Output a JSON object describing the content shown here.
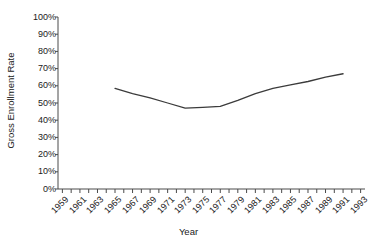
{
  "chart_data": {
    "type": "line",
    "title": "",
    "xlabel": "Year",
    "ylabel": "Gross Enrollment Rate",
    "xlim": [
      1958.5,
      1993.5
    ],
    "ylim": [
      0,
      100
    ],
    "grid": false,
    "legend": "none",
    "line_color": "#3b3b3b",
    "x_tick_labels": [
      "1959",
      "1961",
      "1963",
      "1965",
      "1967",
      "1969",
      "1971",
      "1973",
      "1975",
      "1977",
      "1979",
      "1981",
      "1983",
      "1985",
      "1987",
      "1989",
      "1991",
      "1993"
    ],
    "x_tick_values": [
      1959,
      1961,
      1963,
      1965,
      1967,
      1969,
      1971,
      1973,
      1975,
      1977,
      1979,
      1981,
      1983,
      1985,
      1987,
      1989,
      1991,
      1993
    ],
    "x_minor_ticks": [
      1959,
      1960,
      1961,
      1962,
      1963,
      1964,
      1965,
      1966,
      1967,
      1968,
      1969,
      1970,
      1971,
      1972,
      1973,
      1974,
      1975,
      1976,
      1977,
      1978,
      1979,
      1980,
      1981,
      1982,
      1983,
      1984,
      1985,
      1986,
      1987,
      1988,
      1989,
      1990,
      1991,
      1992,
      1993
    ],
    "y_tick_labels": [
      "100%",
      "90%",
      "80%",
      "70%",
      "60%",
      "50%",
      "40%",
      "30%",
      "20%",
      "10%",
      "0%"
    ],
    "y_tick_values": [
      100,
      90,
      80,
      70,
      60,
      50,
      40,
      30,
      20,
      10,
      0
    ],
    "series": [
      {
        "name": "Gross Enrollment Rate",
        "x": [
          1965,
          1967,
          1969,
          1971,
          1973,
          1975,
          1977,
          1979,
          1981,
          1983,
          1985,
          1987,
          1989,
          1991
        ],
        "values": [
          58.5,
          55.5,
          53.0,
          50.0,
          47.0,
          47.5,
          48.0,
          51.5,
          55.5,
          58.5,
          60.5,
          62.5,
          65.0,
          67.0
        ]
      }
    ]
  }
}
